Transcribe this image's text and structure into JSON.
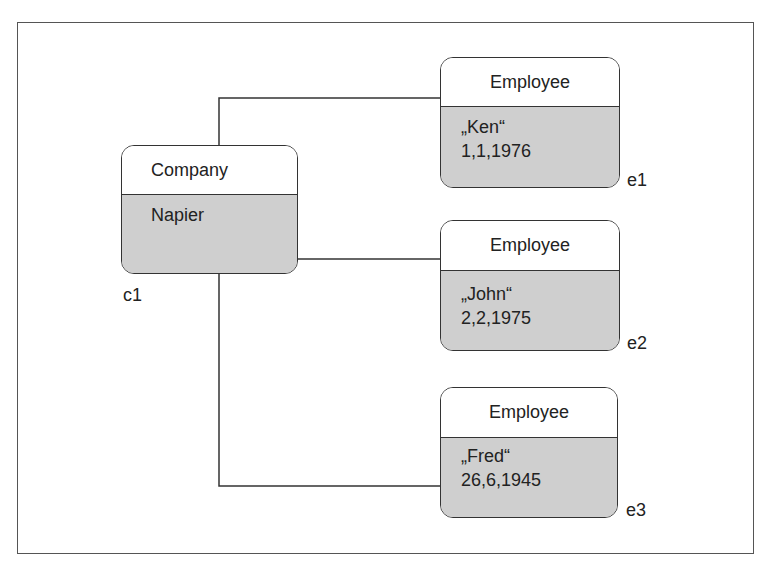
{
  "diagram": {
    "type": "object-diagram",
    "company": {
      "id_label": "c1",
      "class_name": "Company",
      "attributes": [
        "Napier"
      ]
    },
    "employees": [
      {
        "id_label": "e1",
        "class_name": "Employee",
        "attributes": [
          "„Ken“",
          "1,1,1976"
        ]
      },
      {
        "id_label": "e2",
        "class_name": "Employee",
        "attributes": [
          "„John“",
          "2,2,1975"
        ]
      },
      {
        "id_label": "e3",
        "class_name": "Employee",
        "attributes": [
          "„Fred“",
          "26,6,1945"
        ]
      }
    ],
    "links": [
      {
        "from": "c1",
        "to": "e1"
      },
      {
        "from": "c1",
        "to": "e2"
      },
      {
        "from": "c1",
        "to": "e3"
      }
    ],
    "colors": {
      "header": "#ffffff",
      "body": "#cfcfcf",
      "stroke": "#333333"
    }
  }
}
